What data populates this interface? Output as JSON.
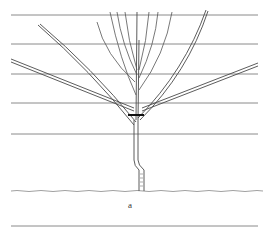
{
  "figure": {
    "label": "a",
    "wires_y": [
      15,
      44,
      74,
      103,
      134
    ],
    "ground_y": 191,
    "baseline_y": 226,
    "colors": {
      "line": "#4a4a4a",
      "wire": "#6d6d6d",
      "cut_mark": "#111111",
      "background": "#ffffff"
    }
  }
}
